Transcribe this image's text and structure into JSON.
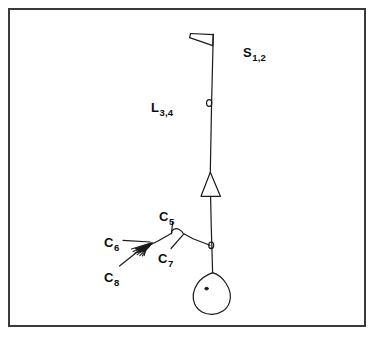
{
  "figure": {
    "background_color": "#ffffff",
    "border_color": "#3a3a3a",
    "ink_color": "#1a1a1a",
    "border": {
      "x": 8,
      "y": 8,
      "width": 358,
      "height": 319,
      "stroke_width": 2
    },
    "labels": [
      {
        "id": "s12",
        "base": "S",
        "sub": "1,2",
        "name": "label-s12"
      },
      {
        "id": "l34",
        "base": "L",
        "sub": "3,4",
        "name": "label-l34"
      },
      {
        "id": "c5",
        "base": "C",
        "sub": "5",
        "name": "label-c5"
      },
      {
        "id": "c6",
        "base": "C",
        "sub": "6",
        "name": "label-c6"
      },
      {
        "id": "c7",
        "base": "C",
        "sub": "7",
        "name": "label-c7"
      },
      {
        "id": "c8",
        "base": "C",
        "sub": "8",
        "name": "label-c8"
      }
    ],
    "parts": {
      "flag": "thin left-pointing wedge at the top of the stem",
      "stem": "slightly slanted vertical stem line",
      "node_upper": "small circle on the stem beside the L label",
      "triangle": "upright open triangle on the stem",
      "node_lower": "small circle where the lower branch meets the stem",
      "branch": "angled branch extending to the lower left",
      "feathers": "fan of short hatch strokes on the branch",
      "loop": "small loop at the branch apex",
      "body": "pear-shaped outline with an interior dot at the stem base"
    }
  }
}
